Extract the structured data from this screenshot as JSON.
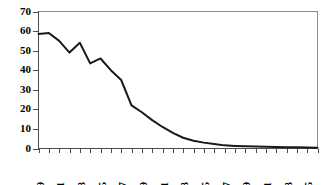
{
  "chart_data": {
    "type": "line",
    "title": "",
    "subtitle": "",
    "xlabel": "",
    "ylabel": "",
    "xlim": [
      1969,
      1996
    ],
    "ylim": [
      0,
      70
    ],
    "grid": false,
    "legend": false,
    "legend_position": "none",
    "line_color": "#1a1a1a",
    "axis_color": "#4d4d4d",
    "frame_color": "#8c8c8c",
    "yticks": [
      0,
      10,
      20,
      30,
      40,
      50,
      60,
      70
    ],
    "ytick_labels": [
      "0",
      "10",
      "20",
      "30",
      "40",
      "50",
      "60",
      "70"
    ],
    "xticks": [
      1969,
      1970,
      1971,
      1972,
      1973,
      1974,
      1975,
      1976,
      1977,
      1978,
      1979,
      1980,
      1981,
      1982,
      1983,
      1984,
      1985,
      1986,
      1987,
      1988,
      1989,
      1990,
      1991,
      1992,
      1993,
      1994,
      1995,
      1996
    ],
    "xtick_labels_shown": [
      "1969",
      "1971",
      "1973",
      "1975",
      "1977",
      "1979",
      "1981",
      "1983",
      "1985",
      "1987",
      "1989",
      "1991",
      "1993",
      "1995"
    ],
    "xtick_label_rotation": -90,
    "xtick_label_interval": 2,
    "series": [
      {
        "name": "series-1",
        "x": [
          1969,
          1970,
          1971,
          1972,
          1973,
          1974,
          1975,
          1976,
          1977,
          1978,
          1979,
          1980,
          1981,
          1982,
          1983,
          1984,
          1985,
          1986,
          1987,
          1988,
          1989,
          1990,
          1991,
          1992,
          1993,
          1994,
          1995,
          1996
        ],
        "values": [
          58.5,
          59,
          55,
          49,
          54,
          43.5,
          46,
          40,
          35,
          22,
          18.5,
          14.5,
          11,
          8,
          5.5,
          4,
          3,
          2.3,
          1.6,
          1.3,
          1.1,
          1,
          0.9,
          0.8,
          0.7,
          0.6,
          0.5,
          0.4
        ]
      }
    ]
  }
}
